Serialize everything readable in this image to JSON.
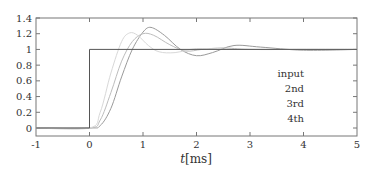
{
  "chart_data": {
    "type": "line",
    "title": "",
    "xlabel": "t[ms]",
    "xlabel_italic_part": "t",
    "xlabel_unit": "[ms]",
    "ylabel": "",
    "xlim": [
      -1,
      5
    ],
    "ylim": [
      -0.1,
      1.4
    ],
    "grid": false,
    "legend_position": "lower right",
    "x_ticks": [
      "-1",
      "0",
      "1",
      "2",
      "3",
      "4",
      "5"
    ],
    "y_ticks": [
      "0",
      "0.2",
      "0.4",
      "0.6",
      "0.8",
      "1",
      "1.2",
      "1.4"
    ],
    "series": [
      {
        "name": "input",
        "color": "#555555",
        "description": "unit step at t=0",
        "x": [
          -1,
          0,
          0,
          5
        ],
        "y": [
          0,
          0,
          1,
          1
        ]
      },
      {
        "name": "2nd",
        "color": "#d8d8d8",
        "x": [
          -1,
          0,
          0.2,
          0.4,
          0.6,
          0.75,
          0.9,
          1.1,
          1.3,
          1.6,
          2.0,
          2.5,
          3.0,
          4.0,
          5.0
        ],
        "y": [
          0,
          0,
          0.2,
          0.7,
          1.1,
          1.21,
          1.18,
          1.05,
          0.97,
          0.96,
          1.01,
          1.0,
          1.0,
          1.0,
          1.0
        ]
      },
      {
        "name": "3rd",
        "color": "#bdbdbd",
        "x": [
          -1,
          0,
          0.2,
          0.4,
          0.6,
          0.8,
          1.0,
          1.2,
          1.5,
          1.8,
          2.1,
          2.5,
          3.0,
          4.0,
          5.0
        ],
        "y": [
          0,
          0,
          0.1,
          0.45,
          0.85,
          1.1,
          1.2,
          1.18,
          1.06,
          0.98,
          1.0,
          1.02,
          1.0,
          1.0,
          1.0
        ]
      },
      {
        "name": "4th",
        "color": "#9a9a9a",
        "x": [
          -1,
          0,
          0.2,
          0.4,
          0.6,
          0.8,
          1.0,
          1.15,
          1.4,
          1.7,
          2.0,
          2.3,
          2.7,
          3.2,
          4.0,
          5.0
        ],
        "y": [
          0,
          0,
          0.03,
          0.25,
          0.65,
          1.0,
          1.22,
          1.28,
          1.18,
          1.0,
          0.92,
          0.96,
          1.05,
          1.03,
          0.99,
          1.0
        ]
      }
    ]
  },
  "legend": {
    "items": [
      "input",
      "2nd",
      "3rd",
      "4th"
    ]
  }
}
